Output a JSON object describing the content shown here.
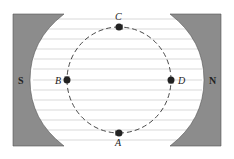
{
  "diagram": {
    "type": "magnet-field-orbit",
    "poles": {
      "left": "S",
      "right": "N"
    },
    "points": [
      {
        "label": "C",
        "position": "top"
      },
      {
        "label": "D",
        "position": "right"
      },
      {
        "label": "A",
        "position": "bottom"
      },
      {
        "label": "B",
        "position": "left"
      }
    ],
    "field_direction": "right-to-left",
    "orbit_direction": "counterclockwise: A to D to C to B to A",
    "colors": {
      "magnet": "#8c8c8c",
      "field_line": "#cfcfcf",
      "orbit": "#333333"
    }
  }
}
